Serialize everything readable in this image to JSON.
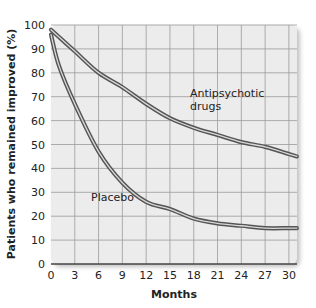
{
  "chart_data": {
    "type": "line",
    "title": "",
    "xlabel": "Months",
    "ylabel": "Patients who remained improved (%)",
    "xlim": [
      0,
      31
    ],
    "ylim": [
      0,
      100
    ],
    "x_ticks": [
      0,
      3,
      6,
      9,
      12,
      15,
      18,
      21,
      24,
      27,
      30
    ],
    "y_ticks": [
      0,
      10,
      20,
      30,
      40,
      50,
      60,
      70,
      80,
      90,
      100
    ],
    "grid": true,
    "legend": "inline annotations",
    "series": [
      {
        "name": "Antipsychotic drugs",
        "x": [
          0,
          3,
          6,
          9,
          12,
          15,
          18,
          21,
          24,
          27,
          30,
          31
        ],
        "values": [
          98,
          89,
          80,
          74,
          67,
          61,
          57,
          54,
          51,
          49,
          46,
          45
        ]
      },
      {
        "name": "Placebo",
        "x": [
          0,
          1,
          3,
          6,
          9,
          12,
          15,
          18,
          21,
          24,
          27,
          30,
          31
        ],
        "values": [
          96,
          83,
          67,
          47,
          34,
          26,
          23,
          19,
          17,
          16,
          15,
          15,
          15
        ]
      }
    ],
    "annotations": [
      {
        "text": "Antipsychotic drugs",
        "lines": [
          "Antipsychotic",
          "drugs"
        ],
        "series": 0
      },
      {
        "text": "Placebo",
        "series": 1
      }
    ]
  },
  "colors": {
    "plot_bg": "#ececec",
    "grid": "#9a9a9a",
    "line_outer": "#555555",
    "line_inner": "#d8d8d8"
  }
}
